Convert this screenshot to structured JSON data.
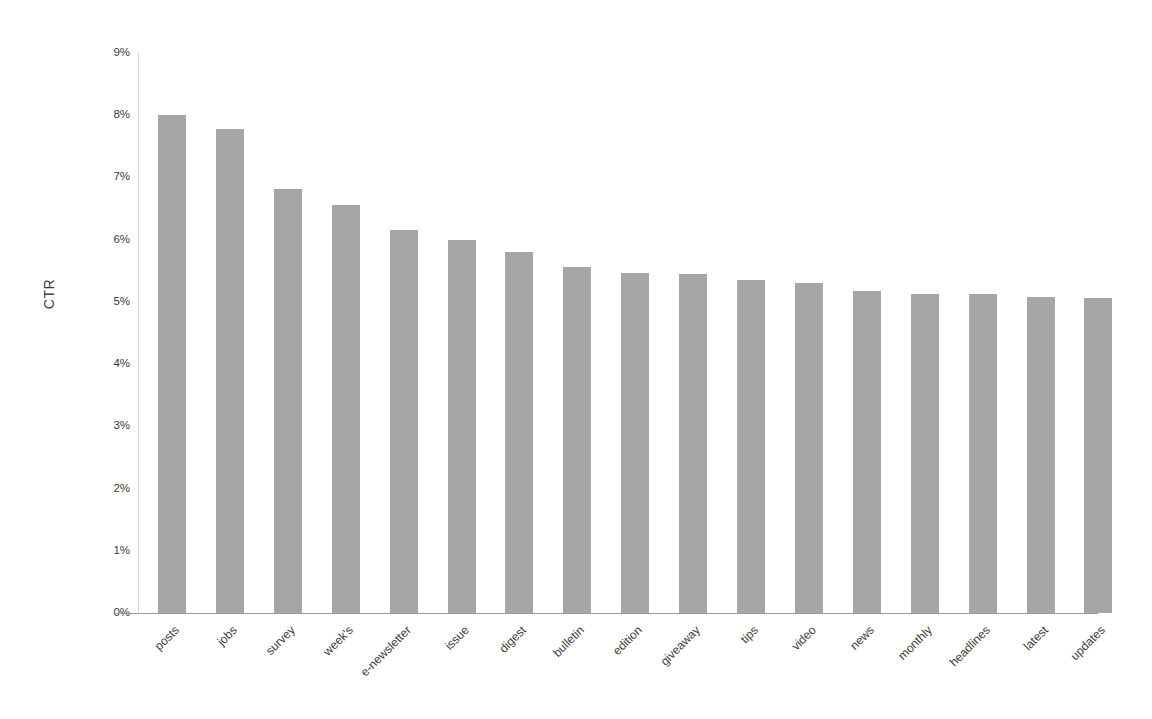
{
  "chart_data": {
    "type": "bar",
    "title": "",
    "subtitle": "",
    "xlabel": "",
    "ylabel": "CTR",
    "ylim": [
      0,
      9
    ],
    "y_tick_labels": [
      "9%",
      "8%",
      "7%",
      "6%",
      "5%",
      "4%",
      "3%",
      "2%",
      "1%",
      "0%"
    ],
    "y_tick_values": [
      9,
      8,
      7,
      6,
      5,
      4,
      3,
      2,
      1,
      0
    ],
    "y_unit": "%",
    "grid": false,
    "legend": null,
    "bar_color": "#a6a6a6",
    "axis_color": "#9b9b9b",
    "categories": [
      "posts",
      "jobs",
      "survey",
      "week's",
      "e-newsletter",
      "issue",
      "digest",
      "bulletin",
      "edition",
      "giveaway",
      "tips",
      "video",
      "news",
      "monthly",
      "headlines",
      "latest",
      "updates"
    ],
    "values": [
      8.0,
      7.78,
      6.81,
      6.56,
      6.15,
      6.0,
      5.81,
      5.56,
      5.46,
      5.45,
      5.36,
      5.31,
      5.17,
      5.12,
      5.12,
      5.08,
      5.07
    ]
  }
}
